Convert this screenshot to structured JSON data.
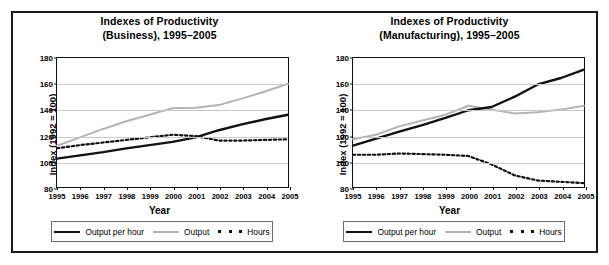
{
  "figure": {
    "panels": [
      {
        "id": "business",
        "title_line1": "Indexes of Productivity",
        "title_line2": "(Business), 1995–2005",
        "ylabel": "Index (1992 = 100)",
        "xlabel": "Year",
        "legend": [
          {
            "label": "Output per hour",
            "style": "solid-black"
          },
          {
            "label": "Output",
            "style": "solid-gray"
          },
          {
            "label": "Hours",
            "style": "dotted-black"
          }
        ]
      },
      {
        "id": "manufacturing",
        "title_line1": "Indexes of Productivity",
        "title_line2": "(Manufacturing), 1995–2005",
        "ylabel": "Index (1992 = 100)",
        "xlabel": "Year",
        "legend": [
          {
            "label": "Output per hour",
            "style": "solid-black"
          },
          {
            "label": "Output",
            "style": "solid-gray"
          },
          {
            "label": "Hours",
            "style": "dotted-black"
          }
        ]
      }
    ]
  },
  "chart_data": [
    {
      "type": "line",
      "id": "business",
      "title": "Indexes of Productivity (Business), 1995–2005",
      "xlabel": "Year",
      "ylabel": "Index (1992 = 100)",
      "x": [
        1995,
        1996,
        1997,
        1998,
        1999,
        2000,
        2001,
        2002,
        2003,
        2004,
        2005
      ],
      "xtick_labels": [
        "1995",
        "1996",
        "1997",
        "1998",
        "1999",
        "2000",
        "2001",
        "2002",
        "2003",
        "2004",
        "2005"
      ],
      "ytick_labels": [
        "80",
        "100",
        "120",
        "140",
        "160",
        "180"
      ],
      "yticks": [
        80,
        100,
        120,
        140,
        160,
        180
      ],
      "ylim": [
        80,
        180
      ],
      "xlim": [
        1995,
        2005
      ],
      "grid": "horizontal",
      "legend_position": "below",
      "series": [
        {
          "name": "Output per hour",
          "color": "#111111",
          "linestyle": "solid",
          "values": [
            102,
            104.5,
            107,
            110,
            112.5,
            115,
            118.5,
            124,
            128.5,
            132.5,
            136
          ]
        },
        {
          "name": "Output",
          "color": "#b4b4b4",
          "linestyle": "solid",
          "values": [
            112,
            118.5,
            125,
            131,
            136,
            141,
            141.5,
            143.5,
            148.5,
            154,
            160
          ]
        },
        {
          "name": "Hours",
          "color": "#111111",
          "linestyle": "dotted",
          "values": [
            110,
            112.5,
            114.5,
            116.5,
            118.5,
            120.5,
            119.5,
            116,
            116,
            116.5,
            117
          ]
        }
      ]
    },
    {
      "type": "line",
      "id": "manufacturing",
      "title": "Indexes of Productivity (Manufacturing), 1995–2005",
      "xlabel": "Year",
      "ylabel": "Index (1992 = 100)",
      "x": [
        1995,
        1996,
        1997,
        1998,
        1999,
        2000,
        2001,
        2002,
        2003,
        2004,
        2005
      ],
      "xtick_labels": [
        "1995",
        "1996",
        "1997",
        "1998",
        "1999",
        "2000",
        "2001",
        "2002",
        "2003",
        "2004",
        "2005"
      ],
      "ytick_labels": [
        "80",
        "100",
        "120",
        "140",
        "160",
        "180"
      ],
      "yticks": [
        80,
        100,
        120,
        140,
        160,
        180
      ],
      "ylim": [
        80,
        180
      ],
      "xlim": [
        1995,
        2005
      ],
      "grid": "horizontal",
      "legend_position": "below",
      "series": [
        {
          "name": "Output per hour",
          "color": "#111111",
          "linestyle": "solid",
          "values": [
            112,
            117.5,
            123,
            128,
            133.5,
            139.5,
            142,
            150,
            159.5,
            164.5,
            171
          ]
        },
        {
          "name": "Output",
          "color": "#b4b4b4",
          "linestyle": "solid",
          "values": [
            117,
            120.5,
            127,
            131.5,
            136,
            143,
            140,
            137,
            138,
            140,
            143
          ]
        },
        {
          "name": "Hours",
          "color": "#111111",
          "linestyle": "dotted",
          "values": [
            105,
            105,
            106,
            105.5,
            105,
            104,
            97.5,
            89,
            85,
            84,
            83
          ]
        }
      ]
    }
  ]
}
